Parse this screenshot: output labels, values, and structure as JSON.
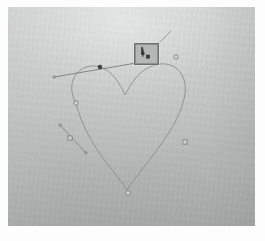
{
  "app": {
    "title": "Vector Path Editor Canvas",
    "mode_label": "Pen Tool"
  },
  "canvas": {
    "background_color": "#bcbfbe",
    "highlight_color": "#d9dbda",
    "frame_color": "#fdfdfd",
    "width": 247,
    "height": 219
  },
  "path": {
    "name": "heart-path",
    "stroke_color": "#8a8d8c",
    "stroke_width": 0.9,
    "closed": true,
    "description": "heart outline bezier path",
    "d": "M 68 96 C 55 74, 73 54, 92 60 C 105 64, 112 77, 117 88 C 123 76, 132 62, 147 58 C 168 52, 182 70, 176 92 C 170 118, 148 144, 130 168 C 126 173, 122 178, 119 183 C 115 177, 110 170, 105 164 C 90 146, 74 122, 68 96 Z"
  },
  "anchor_points": [
    {
      "id": "anchor-top-left-lobe",
      "x": 68,
      "y": 96,
      "shape": "circle",
      "selected": false,
      "label": "left lobe anchor"
    },
    {
      "id": "anchor-top-cusp",
      "x": 92,
      "y": 60,
      "shape": "dot",
      "selected": true,
      "label": "selected top anchor"
    },
    {
      "id": "anchor-top-right-lobe",
      "x": 168,
      "y": 50,
      "shape": "circle",
      "selected": false,
      "label": "right lobe top anchor"
    },
    {
      "id": "anchor-left-side",
      "x": 62,
      "y": 131,
      "shape": "square",
      "selected": false,
      "label": "left side anchor"
    },
    {
      "id": "anchor-right-side",
      "x": 177,
      "y": 135,
      "shape": "square",
      "selected": false,
      "label": "right side anchor"
    },
    {
      "id": "anchor-bottom-tip",
      "x": 120,
      "y": 186,
      "shape": "circle",
      "selected": false,
      "label": "bottom tip anchor"
    }
  ],
  "tangent_handles": [
    {
      "id": "handle-top",
      "label": "top tangent handle",
      "x1": 46,
      "y1": 70,
      "x2": 146,
      "y2": 53,
      "control_x": 92,
      "control_y": 60,
      "color": "#6e716f"
    },
    {
      "id": "handle-left",
      "label": "left tangent handle",
      "x1": 52,
      "y1": 118,
      "x2": 78,
      "y2": 146,
      "control_x": 62,
      "control_y": 131,
      "color": "#7b7e7d"
    }
  ],
  "cursor": {
    "name": "pen-tool-cursor",
    "label": "Pen tool cursor",
    "box_x": 126,
    "box_y": 36,
    "box_width": 25,
    "box_height": 22,
    "border_color": "#6b6e6d",
    "glyph_color": "#2a2c2b",
    "badge_label": "add-point"
  },
  "leader_line": {
    "label": "cursor leader line",
    "x1": 151,
    "y1": 36,
    "x2": 163,
    "y2": 24,
    "color": "#8a8d8c"
  }
}
